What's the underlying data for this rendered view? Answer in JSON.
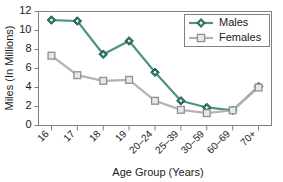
{
  "chart_data": {
    "type": "line",
    "title": "",
    "xlabel": "Age Group (Years)",
    "ylabel": "Miles (In Millions)",
    "ylim": [
      0,
      12
    ],
    "ytick_values": [
      0,
      2,
      4,
      6,
      8,
      10,
      12
    ],
    "ytick_labels": [
      "0",
      "2",
      "4",
      "6",
      "8",
      "10",
      "12"
    ],
    "grid": false,
    "legend_position": "top-right",
    "categories": [
      "16",
      "17",
      "18",
      "19",
      "20–24",
      "25–39",
      "30–59",
      "60–69",
      "70+"
    ],
    "series": [
      {
        "name": "Males",
        "color": "#2f7d6e",
        "marker": "diamond",
        "values": [
          11.1,
          11.0,
          7.5,
          8.9,
          5.6,
          2.6,
          1.9,
          1.6,
          4.1
        ]
      },
      {
        "name": "Females",
        "color": "#b3b3b3",
        "marker": "square",
        "values": [
          7.35,
          5.3,
          4.7,
          4.8,
          2.6,
          1.65,
          1.3,
          1.6,
          4.0
        ]
      }
    ]
  },
  "legend": {
    "entries": [
      {
        "label": "Males"
      },
      {
        "label": "Females"
      }
    ]
  },
  "axes": {
    "y_title": "Miles (In Millions)",
    "x_title": "Age Group (Years)"
  },
  "colors": {
    "males": "#2f7d6e",
    "females": "#b3b3b3",
    "axis": "#808080",
    "text": "#1a1a1a",
    "background": "#ffffff"
  }
}
